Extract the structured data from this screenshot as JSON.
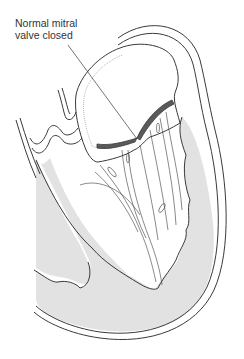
{
  "figure": {
    "label_line1": "Normal mitral",
    "label_line2": "valve closed"
  },
  "colors": {
    "line": "#3a3a3a",
    "muscle_fill": "#e2e2e2",
    "valve_leaflet": "#5a5a5a",
    "background": "#ffffff"
  }
}
